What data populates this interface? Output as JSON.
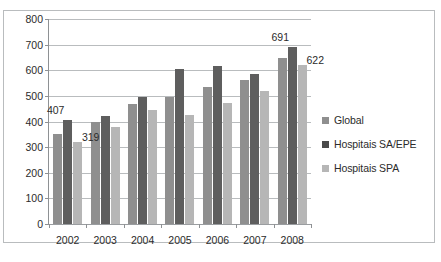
{
  "document": {
    "title_fragment": "",
    "caption_fragment": ""
  },
  "legend": {
    "position": "right",
    "entries": [
      {
        "label": "Global",
        "swatch": "legend-swatch-global"
      },
      {
        "label": "Hospitais SA/EPE",
        "swatch": "legend-swatch-sa-epe"
      },
      {
        "label": "Hospitais SPA",
        "swatch": "legend-swatch-spa"
      }
    ]
  },
  "chart_data": {
    "type": "bar",
    "title": "",
    "xlabel": "",
    "ylabel": "",
    "ylim": [
      0,
      800
    ],
    "ytick_step": 100,
    "yticks": [
      0,
      100,
      200,
      300,
      400,
      500,
      600,
      700,
      800
    ],
    "grid": true,
    "categories": [
      "2002",
      "2003",
      "2004",
      "2005",
      "2006",
      "2007",
      "2008"
    ],
    "series": [
      {
        "name": "Global",
        "color": "#8f8f8f",
        "values": [
          350,
          400,
          467,
          494,
          533,
          563,
          648
        ]
      },
      {
        "name": "Hospitais SA/EPE",
        "color": "#5e5e5e",
        "values": [
          407,
          422,
          495,
          605,
          618,
          587,
          691
        ]
      },
      {
        "name": "Hospitais SPA",
        "color": "#b6b6b6",
        "values": [
          319,
          378,
          445,
          424,
          471,
          520,
          622
        ]
      }
    ],
    "annotations": [
      {
        "text": "407",
        "category": "2002",
        "series": "Hospitais SA/EPE",
        "value": 407
      },
      {
        "text": "319",
        "category": "2002",
        "series": "Hospitais SPA",
        "value": 319
      },
      {
        "text": "691",
        "category": "2008",
        "series": "Hospitais SA/EPE",
        "value": 691
      },
      {
        "text": "622",
        "category": "2008",
        "series": "Hospitais SPA",
        "value": 622
      }
    ]
  }
}
